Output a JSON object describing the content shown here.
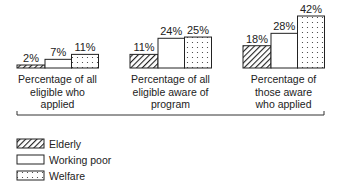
{
  "chart_data": {
    "type": "bar",
    "title": "",
    "xlabel": "",
    "ylabel": "",
    "ylim": [
      0,
      45
    ],
    "grid": false,
    "legend_position": "bottom-left",
    "categories": [
      "Percentage of all eligible who applied",
      "Percentage of all eligible aware of program",
      "Percentage of those aware who applied"
    ],
    "category_lines": [
      [
        "Percentage of all",
        "eligible who",
        "applied"
      ],
      [
        "Percentage of all",
        "eligible aware of",
        "program"
      ],
      [
        "Percentage of",
        "those aware",
        "who applied"
      ]
    ],
    "series": [
      {
        "name": "Elderly",
        "pattern": "hatched",
        "values": [
          2,
          11,
          18
        ],
        "labels": [
          "2%",
          "11%",
          "18%"
        ]
      },
      {
        "name": "Working poor",
        "pattern": "blank",
        "values": [
          7,
          24,
          28
        ],
        "labels": [
          "7%",
          "24%",
          "28%"
        ]
      },
      {
        "name": "Welfare",
        "pattern": "dotted",
        "values": [
          11,
          25,
          42
        ],
        "labels": [
          "11%",
          "25%",
          "42%"
        ]
      }
    ]
  },
  "legend": {
    "items": [
      {
        "label": "Elderly",
        "pattern": "hatched"
      },
      {
        "label": "Working poor",
        "pattern": "blank"
      },
      {
        "label": "Welfare",
        "pattern": "dotted"
      }
    ]
  },
  "colors": {
    "ink": "#222222",
    "background": "#ffffff"
  }
}
